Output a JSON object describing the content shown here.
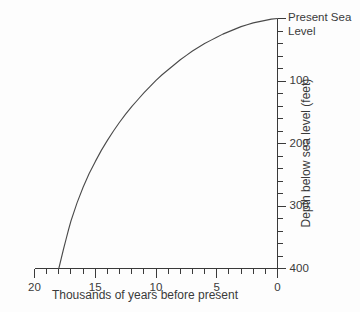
{
  "chart_data": {
    "type": "line",
    "title": "",
    "xlabel": "Thousands of years before present",
    "ylabel": "Depth below sea level (feet)",
    "xlim": [
      20,
      0
    ],
    "ylim": [
      0,
      400
    ],
    "x_axis_reversed": true,
    "y_axis_inverted": true,
    "grid": false,
    "legend": null,
    "x_tick_labels": [
      "20",
      "15",
      "10",
      "5",
      "0"
    ],
    "x_major_ticks": [
      20,
      15,
      10,
      5,
      0
    ],
    "x_minor_tick_step": 1,
    "y_tick_labels": [
      "Present Sea Level",
      "100",
      "200",
      "300",
      "400"
    ],
    "y_major_ticks": [
      0,
      100,
      200,
      300,
      400
    ],
    "y_minor_tick_step": 20,
    "sea_level_label_line1": "Present Sea",
    "sea_level_label_line2": "Level",
    "series": [
      {
        "name": "Sea level rise since last glacial maximum",
        "x": [
          18.0,
          17.9,
          17.8,
          17.6,
          17.4,
          17.2,
          17.0,
          16.5,
          16.0,
          15.5,
          15.0,
          14.5,
          14.0,
          13.5,
          13.0,
          12.5,
          12.0,
          11.5,
          11.0,
          10.5,
          10.0,
          9.5,
          9.0,
          8.5,
          8.0,
          7.5,
          7.0,
          6.5,
          6.0,
          5.5,
          5.0,
          4.5,
          4.0,
          3.5,
          3.0,
          2.5,
          2.0,
          1.5,
          1.0,
          0.5,
          0.0
        ],
        "y": [
          400,
          392,
          384,
          368,
          353,
          338,
          324,
          295,
          270,
          248,
          229,
          211,
          195,
          180,
          166,
          153,
          141,
          130,
          119,
          109,
          99,
          90,
          82,
          74,
          66,
          59,
          52,
          46,
          40,
          35,
          30,
          25,
          21,
          17,
          13,
          10,
          7,
          5,
          3,
          1,
          0
        ]
      }
    ],
    "line_color": "#4a4a4a",
    "axis_color": "#3a3a3a",
    "background_color": "#fdfdfd"
  }
}
